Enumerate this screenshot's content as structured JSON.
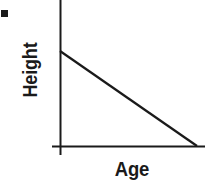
{
  "figure": {
    "width": 205,
    "height": 183,
    "background_color": "#ffffff",
    "ink_color": "#1a1a1a"
  },
  "bullet": {
    "name": "square-bullet",
    "visible": true
  },
  "axes": {
    "y_title": "Height",
    "x_title": "Age"
  },
  "chart_data": {
    "type": "line",
    "title": "",
    "subtitle": "",
    "xlabel": "Age",
    "ylabel": "Height",
    "xlim": [
      0,
      1
    ],
    "ylim": [
      0,
      1
    ],
    "grid": false,
    "legend": null,
    "tick_labels": {
      "x": [],
      "y": []
    },
    "annotations": [],
    "series": [
      {
        "name": "Height vs Age",
        "x": [
          0,
          1
        ],
        "y": [
          1,
          0
        ],
        "description": "straight line decreasing from upper-left to lower-right",
        "color": "#1a1a1a",
        "line_width": 2
      }
    ]
  },
  "geometry": {
    "y_axis": {
      "x": 60,
      "y_top": 0,
      "y_bottom": 155
    },
    "x_axis": {
      "y": 146,
      "x_left": 52,
      "x_right": 205
    },
    "trend_line": {
      "x1": 60,
      "y1": 51,
      "x2": 197,
      "y2": 146
    }
  }
}
